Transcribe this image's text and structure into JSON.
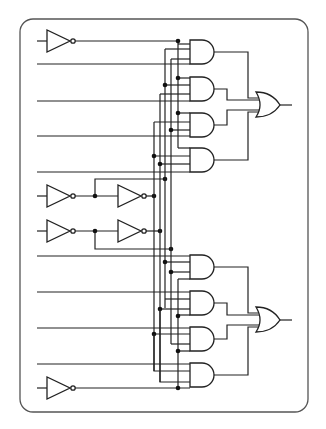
{
  "diagram": {
    "type": "logic-circuit",
    "colors": {
      "stroke": "#222222",
      "background": "#ffffff",
      "frame": "#555555"
    },
    "components": {
      "inverters": 6,
      "and_gates": 8,
      "or_gates": 2,
      "junction_dots": 28
    },
    "blocks": [
      {
        "name": "upper-block",
        "and_gates": 4,
        "or_gate": 1,
        "data_inputs": 4
      },
      {
        "name": "lower-block",
        "and_gates": 4,
        "or_gate": 1,
        "data_inputs": 4
      }
    ]
  }
}
